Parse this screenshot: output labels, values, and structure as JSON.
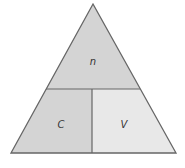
{
  "diagram": {
    "type": "formula-triangle",
    "labels": {
      "top": "n",
      "bottom_left": "C",
      "bottom_right": "V"
    },
    "colors": {
      "top_fill": "#d4d4d4",
      "bottom_left_fill": "#d4d4d4",
      "bottom_right_fill": "#e8e8e8",
      "stroke": "#666666"
    }
  }
}
